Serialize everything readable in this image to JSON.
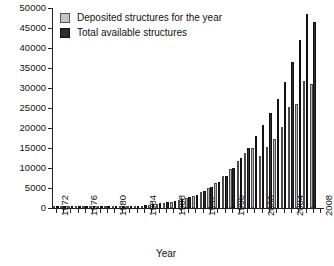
{
  "chart_data": {
    "type": "bar",
    "title": "",
    "xlabel": "Year",
    "ylabel": "",
    "ylim": [
      0,
      50000
    ],
    "ytick_values": [
      0,
      5000,
      10000,
      15000,
      20000,
      25000,
      30000,
      35000,
      40000,
      45000,
      50000
    ],
    "ytick_labels": [
      "0",
      "5000",
      "10000",
      "15000",
      "20000",
      "25000",
      "30000",
      "35000",
      "40000",
      "45000",
      "50000"
    ],
    "xlim": [
      1971,
      2008
    ],
    "xtick_labels": [
      "1972",
      "1976",
      "1980",
      "1984",
      "1988",
      "1992",
      "1996",
      "2000",
      "2004",
      "2008"
    ],
    "xtick_values": [
      1972,
      1976,
      1980,
      1984,
      1988,
      1992,
      1996,
      2000,
      2004,
      2008
    ],
    "grid": false,
    "legend_position": "top-left",
    "categories": [
      1972,
      1973,
      1974,
      1975,
      1976,
      1977,
      1978,
      1979,
      1980,
      1981,
      1982,
      1983,
      1984,
      1985,
      1986,
      1987,
      1988,
      1989,
      1990,
      1991,
      1992,
      1993,
      1994,
      1995,
      1996,
      1997,
      1998,
      1999,
      2000,
      2001,
      2002,
      2003,
      2004,
      2005,
      2006,
      2007
    ],
    "series": [
      {
        "name": "Deposited structures for the year",
        "color": "#b9b9b9",
        "values": [
          10,
          15,
          20,
          25,
          30,
          35,
          45,
          55,
          70,
          85,
          100,
          120,
          145,
          175,
          210,
          260,
          320,
          410,
          520,
          660,
          840,
          1050,
          1300,
          1600,
          1950,
          2350,
          2700,
          3000,
          2600,
          3100,
          3500,
          4100,
          5200,
          5400,
          6400,
          6200
        ]
      },
      {
        "name": "Total available structures",
        "color": "#2e2e2e",
        "values": [
          15,
          30,
          50,
          75,
          105,
          140,
          185,
          240,
          310,
          395,
          495,
          615,
          760,
          935,
          1145,
          1405,
          1725,
          2135,
          2655,
          3315,
          4155,
          5205,
          6505,
          8105,
          10055,
          12405,
          15105,
          18105,
          20705,
          23805,
          27305,
          31405,
          36605,
          42005,
          48405,
          54605
        ]
      }
    ],
    "legend": [
      {
        "label": "Deposited structures for the year",
        "swatch": "deposited"
      },
      {
        "label": "Total available structures",
        "swatch": "total"
      }
    ],
    "bar_pixel_data": {
      "deposited_tops": [
        207.5,
        207.5,
        207.5,
        207.4,
        207.3,
        207.2,
        207.1,
        206.9,
        206.7,
        206.5,
        206.2,
        205.9,
        205.5,
        204.9,
        204.2,
        203.2,
        201.9,
        200.3,
        198.2,
        195.6,
        192.2,
        187.9,
        182.6,
        176.2,
        168.9,
        160.8,
        153.2,
        147.8,
        155.8,
        147.0,
        139.0,
        127.4,
        107.0,
        103.5,
        80.5,
        84.0
      ],
      "total_tops": [
        207.4,
        207.1,
        206.8,
        206.4,
        206.0,
        205.5,
        204.9,
        204.2,
        203.4,
        202.4,
        201.3,
        200.0,
        198.5,
        196.6,
        194.4,
        191.6,
        188.2,
        184.0,
        178.7,
        172.2,
        164.1,
        154.1,
        141.8,
        126.9,
        108.9,
        87.0,
        60.0,
        28.0,
        177.0,
        163.0,
        145.0,
        120.0,
        92.5,
        60.0,
        26.5,
        22.0
      ]
    }
  }
}
